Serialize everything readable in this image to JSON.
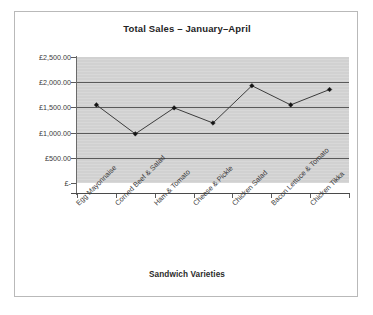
{
  "chart_data": {
    "type": "line",
    "title": "Total Sales – January–April",
    "xlabel": "Sandwich Varieties",
    "ylabel": "",
    "categories": [
      "Egg Mayonnaise",
      "Corned Beef & Salad",
      "Ham & Tomato",
      "Cheese & Pickle",
      "Chicken Salad",
      "Bacon Lettuce & Tomato",
      "Chicken Tikka"
    ],
    "values": [
      1550,
      975,
      1490,
      1190,
      1930,
      1550,
      1855
    ],
    "ylim": [
      0,
      2500
    ],
    "ytick_values": [
      0,
      500,
      1000,
      1500,
      2000,
      2500
    ],
    "ytick_labels": [
      "£-",
      "£500.00",
      "£1,000.00",
      "£1,500.00",
      "£2,000.00",
      "£2,500.00"
    ],
    "grid": "horizontal",
    "legend": "none",
    "marker": "diamond",
    "plot_background_color": "#d4d4d4",
    "line_color": "#3c3c3c",
    "marker_color": "#141414",
    "gridline_color": "#5a5a5a",
    "label_rotation": -45,
    "series": [
      {
        "name": "Total Sales",
        "values": [
          1550,
          975,
          1490,
          1190,
          1930,
          1550,
          1855
        ]
      }
    ]
  }
}
